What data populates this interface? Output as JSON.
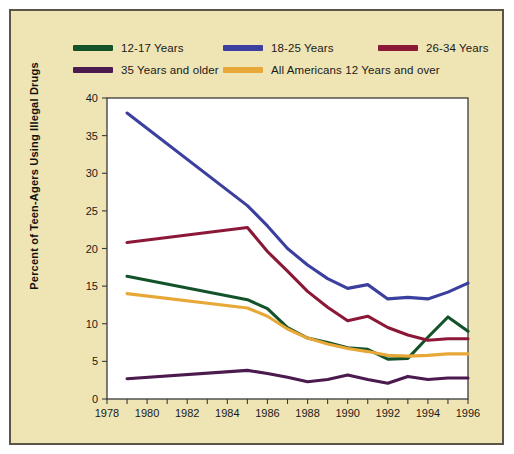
{
  "figure": {
    "background_color": "#efe4b4",
    "border_color": "#5d5448",
    "plot_background": "#ffffff"
  },
  "chart_data": {
    "type": "line",
    "title": "",
    "xlabel": "",
    "ylabel": "Percent of Teen-Agers Using Illegal Drugs",
    "xlim": [
      1978,
      1996
    ],
    "ylim": [
      0,
      40
    ],
    "ytick_step": 5,
    "yticks": [
      0,
      5,
      10,
      15,
      20,
      25,
      30,
      35,
      40
    ],
    "xticks": [
      1978,
      1979,
      1980,
      1981,
      1982,
      1983,
      1984,
      1985,
      1986,
      1987,
      1988,
      1989,
      1990,
      1991,
      1992,
      1993,
      1994,
      1995,
      1996
    ],
    "xtick_labels": [
      "1978",
      "1980",
      "1982",
      "1984",
      "1986",
      "1988",
      "1990",
      "1992",
      "1994",
      "1996"
    ],
    "xtick_labeled_years": [
      1978,
      1980,
      1982,
      1984,
      1986,
      1988,
      1990,
      1992,
      1994,
      1996
    ],
    "grid": false,
    "legend_position": "top",
    "x": [
      1979,
      1985,
      1986,
      1987,
      1988,
      1989,
      1990,
      1991,
      1992,
      1993,
      1994,
      1995,
      1996
    ],
    "series": [
      {
        "name": "12-17 Years",
        "color": "#14532a",
        "x": [
          1979,
          1985,
          1986,
          1987,
          1988,
          1989,
          1990,
          1991,
          1992,
          1993,
          1994,
          1995,
          1996
        ],
        "values": [
          16.3,
          13.2,
          12.0,
          9.5,
          8.1,
          7.5,
          6.8,
          6.6,
          5.3,
          5.4,
          8.2,
          10.9,
          9.0
        ]
      },
      {
        "name": "18-25 Years",
        "color": "#3b3f9e",
        "x": [
          1979,
          1985,
          1986,
          1987,
          1988,
          1989,
          1990,
          1991,
          1992,
          1993,
          1994,
          1995,
          1996
        ],
        "values": [
          38.0,
          25.7,
          23.0,
          20.0,
          17.8,
          16.0,
          14.7,
          15.2,
          13.3,
          13.5,
          13.3,
          14.2,
          15.4
        ]
      },
      {
        "name": "26-34 Years",
        "color": "#8c1838",
        "x": [
          1979,
          1985,
          1986,
          1987,
          1988,
          1989,
          1990,
          1991,
          1992,
          1993,
          1994,
          1995,
          1996
        ],
        "values": [
          20.8,
          22.8,
          19.6,
          17.0,
          14.3,
          12.2,
          10.4,
          11.0,
          9.5,
          8.5,
          7.8,
          8.0,
          8.0
        ]
      },
      {
        "name": "35 Years and older",
        "color": "#4b1a4f",
        "x": [
          1979,
          1985,
          1986,
          1987,
          1988,
          1989,
          1990,
          1991,
          1992,
          1993,
          1994,
          1995,
          1996
        ],
        "values": [
          2.7,
          3.8,
          3.4,
          2.9,
          2.3,
          2.6,
          3.2,
          2.6,
          2.1,
          3.0,
          2.6,
          2.8,
          2.8
        ]
      },
      {
        "name": "All Americans 12 Years and over",
        "color": "#e8a838",
        "x": [
          1979,
          1985,
          1986,
          1987,
          1988,
          1989,
          1990,
          1991,
          1992,
          1993,
          1994,
          1995,
          1996
        ],
        "values": [
          14.0,
          12.1,
          11.0,
          9.3,
          8.1,
          7.3,
          6.7,
          6.3,
          5.8,
          5.7,
          5.8,
          6.0,
          6.0
        ]
      }
    ]
  },
  "legend": {
    "rows": [
      [
        {
          "label": "12-17 Years",
          "color": "#14532a",
          "series_index": 0
        },
        {
          "label": "18-25 Years",
          "color": "#3b3f9e",
          "series_index": 1
        },
        {
          "label": "26-34 Years",
          "color": "#8c1838",
          "series_index": 2
        }
      ],
      [
        {
          "label": "35 Years and older",
          "color": "#4b1a4f",
          "series_index": 3
        },
        {
          "label": "All Americans 12 Years and over",
          "color": "#e8a838",
          "series_index": 4
        }
      ]
    ]
  }
}
